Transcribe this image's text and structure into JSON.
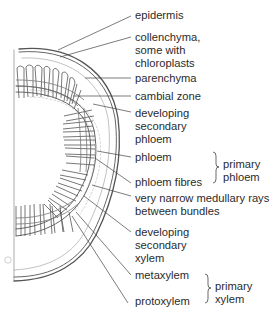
{
  "diagram": {
    "labels": {
      "epidermis": [
        "epidermis"
      ],
      "collenchyma": [
        "collenchyma,",
        "some with",
        "chloroplasts"
      ],
      "parenchyma": [
        "parenchyma"
      ],
      "cambial_zone": [
        "cambial zone"
      ],
      "developing_secondary_phloem": [
        "developing",
        "secondary",
        "phloem"
      ],
      "phloem": [
        "phloem"
      ],
      "phloem_fibres": [
        "phloem fibres"
      ],
      "medullary_rays": [
        "very narrow medullary rays",
        "between bundles"
      ],
      "developing_secondary_xylem": [
        "developing",
        "secondary",
        "xylem"
      ],
      "metaxylem": [
        "metaxylem"
      ],
      "protoxylem": [
        "protoxylem"
      ]
    },
    "groups": {
      "primary_phloem": [
        "primary",
        "phloem"
      ],
      "primary_xylem": [
        "primary",
        "xylem"
      ]
    },
    "corner_mark": "A",
    "colors": {
      "line": "#555555",
      "text": "#2b2b2b",
      "faint": "#9a9a9a",
      "background": "#ffffff"
    }
  }
}
